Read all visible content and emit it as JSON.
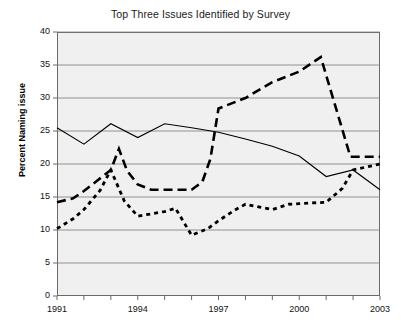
{
  "chart_data": {
    "type": "line",
    "title": "Top Three Issues Identified by Survey",
    "xlabel": "",
    "ylabel": "Percent Naming issue",
    "xlim": [
      1991,
      2003
    ],
    "ylim": [
      0,
      40
    ],
    "y_ticks": [
      0,
      5,
      10,
      15,
      20,
      25,
      30,
      35,
      40
    ],
    "x_ticks": [
      1991,
      1992,
      1993,
      1994,
      1995,
      1996,
      1997,
      1998,
      1999,
      2000,
      2001,
      2002,
      2003
    ],
    "x_tick_labels": [
      "1991",
      "",
      "",
      "1994",
      "",
      "",
      "1997",
      "",
      "",
      "2000",
      "",
      "",
      "2003"
    ],
    "grid": "horizontal",
    "legend": "none",
    "plot_background": "#f0f0f0",
    "grid_color": "#7a7a7a",
    "axis_color": "#6a6a6a",
    "series_color": "#000000",
    "x": [
      1991,
      1992,
      1993,
      1994,
      1995,
      1996,
      1997,
      1998,
      1999,
      2000,
      2001,
      2002,
      2003
    ],
    "series": [
      {
        "name": "issue-solid",
        "style": "solid",
        "values": [
          25.5,
          23.0,
          26.1,
          24.0,
          26.1,
          25.5,
          24.8,
          23.8,
          22.7,
          21.2,
          18.1,
          19.1,
          16.1
        ]
      },
      {
        "name": "issue-long-dash",
        "style": "long-dash",
        "values": [
          14.2,
          15.9,
          19.1,
          16.1,
          16.1,
          17.2,
          28.4,
          30.0,
          32.4,
          34.0,
          36.2,
          21.1,
          21.1
        ]
      },
      {
        "name": "issue-dotted",
        "style": "dotted",
        "values": [
          10.2,
          13.1,
          14.5,
          12.1,
          12.9,
          9.2,
          11.4,
          13.9,
          13.1,
          14.0,
          14.2,
          19.1,
          20.0
        ]
      }
    ],
    "series_detail": [
      {
        "name": "issue-solid",
        "points": [
          [
            1991,
            25.5
          ],
          [
            1992,
            23.0
          ],
          [
            1993,
            26.1
          ],
          [
            1994,
            24.0
          ],
          [
            1995,
            26.1
          ],
          [
            1996,
            25.5
          ],
          [
            1997,
            24.8
          ],
          [
            1998,
            23.8
          ],
          [
            1999,
            22.7
          ],
          [
            2000,
            21.2
          ],
          [
            2001,
            18.1
          ],
          [
            2002,
            19.1
          ],
          [
            2003,
            16.1
          ]
        ]
      },
      {
        "name": "issue-long-dash",
        "points": [
          [
            1991,
            14.2
          ],
          [
            1991.6,
            14.8
          ],
          [
            1992,
            15.9
          ],
          [
            1992.5,
            17.5
          ],
          [
            1993,
            19.1
          ],
          [
            1993.3,
            22.3
          ],
          [
            1993.6,
            19.0
          ],
          [
            1994,
            16.9
          ],
          [
            1994.5,
            16.1
          ],
          [
            1995,
            16.1
          ],
          [
            1996,
            16.1
          ],
          [
            1996.4,
            17.3
          ],
          [
            1996.7,
            20.8
          ],
          [
            1997,
            28.4
          ],
          [
            1998,
            30.0
          ],
          [
            1999,
            32.4
          ],
          [
            2000,
            34.0
          ],
          [
            2000.8,
            36.2
          ],
          [
            2001.9,
            21.1
          ],
          [
            2003,
            21.1
          ]
        ]
      },
      {
        "name": "issue-dotted",
        "points": [
          [
            1991,
            10.2
          ],
          [
            1991.6,
            11.7
          ],
          [
            1992,
            13.1
          ],
          [
            1992.6,
            16.0
          ],
          [
            1993,
            19.1
          ],
          [
            1993.5,
            14.4
          ],
          [
            1994,
            12.1
          ],
          [
            1995,
            12.8
          ],
          [
            1995.4,
            13.3
          ],
          [
            1996,
            9.2
          ],
          [
            1996.6,
            10.2
          ],
          [
            1997,
            11.4
          ],
          [
            1997.6,
            13.0
          ],
          [
            1998,
            13.9
          ],
          [
            1999,
            13.1
          ],
          [
            1999.6,
            13.9
          ],
          [
            2000,
            14.0
          ],
          [
            2001,
            14.2
          ],
          [
            2001.6,
            16.3
          ],
          [
            2002,
            19.1
          ],
          [
            2003,
            20.0
          ]
        ]
      }
    ]
  }
}
